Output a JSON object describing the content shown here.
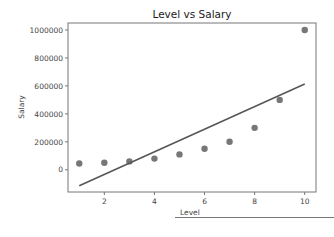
{
  "chart_data": {
    "type": "scatter",
    "title": "Level vs Salary",
    "xlabel": "Level",
    "ylabel": "Salary",
    "xlim": [
      0.55,
      10.45
    ],
    "ylim": [
      -159000,
      1050000
    ],
    "grid": false,
    "legend": null,
    "x_ticks": [
      2,
      4,
      6,
      8,
      10
    ],
    "y_ticks": [
      0,
      200000,
      400000,
      600000,
      800000,
      1000000
    ],
    "y_tick_labels": [
      "0",
      "200000",
      "400000",
      "600000",
      "800000",
      "1000000"
    ],
    "series": [
      {
        "name": "Salary (actual)",
        "kind": "scatter",
        "color": "#777777",
        "x": [
          1,
          2,
          3,
          4,
          5,
          6,
          7,
          8,
          9,
          10
        ],
        "y": [
          45000,
          50000,
          60000,
          80000,
          110000,
          150000,
          200000,
          300000,
          500000,
          1000000
        ]
      },
      {
        "name": "Linear regression fit",
        "kind": "line",
        "color": "#555555",
        "x": [
          1,
          10
        ],
        "y": [
          -114454,
          613455
        ]
      }
    ]
  }
}
